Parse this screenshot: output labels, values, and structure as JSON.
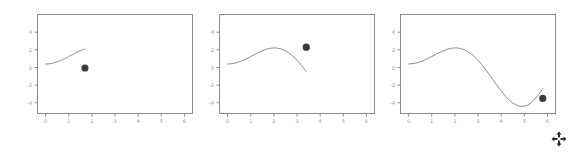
{
  "figure": {
    "background_color": "#ffffff",
    "panel_count": 3,
    "axes_color": "#888888",
    "line_color": "#808080",
    "marker_color": "#3c3c3c",
    "tick_label_color": "#999999"
  },
  "cursor": {
    "name": "move-cursor",
    "glyph": "move-four-arrows"
  },
  "chart_data": [
    {
      "type": "line",
      "title": "",
      "xlabel": "",
      "ylabel": "",
      "xlim": [
        -0.35,
        6.35
      ],
      "ylim": [
        -5.6,
        5.6
      ],
      "xticks": [
        0,
        1,
        2,
        3,
        4,
        5,
        6
      ],
      "yticks": [
        4,
        2,
        0,
        -2,
        -4
      ],
      "xtick_labels": [
        "0",
        "1",
        "2",
        "3",
        "4",
        "5",
        "6"
      ],
      "ytick_labels": [
        "4",
        "2",
        "0",
        "-2",
        "-4"
      ],
      "grid": false,
      "legend": false,
      "series": [
        {
          "name": "x*sin(x)",
          "x": [
            0.0,
            0.1,
            0.2,
            0.3,
            0.4,
            0.5,
            0.6,
            0.7,
            0.8,
            0.9,
            1.0,
            1.1,
            1.2,
            1.3,
            1.4,
            1.5,
            1.6,
            1.7
          ],
          "y": [
            0.0,
            0.01,
            0.04,
            0.089,
            0.156,
            0.24,
            0.339,
            0.451,
            0.574,
            0.705,
            0.841,
            0.98,
            1.118,
            1.252,
            1.379,
            1.496,
            1.599,
            1.685
          ]
        }
      ],
      "marker_point": {
        "x": 1.7,
        "y": -0.45
      }
    },
    {
      "type": "line",
      "title": "",
      "xlabel": "",
      "ylabel": "",
      "xlim": [
        -0.35,
        6.35
      ],
      "ylim": [
        -5.6,
        5.6
      ],
      "xticks": [
        0,
        1,
        2,
        3,
        4,
        5,
        6
      ],
      "yticks": [
        4,
        2,
        0,
        -2,
        -4
      ],
      "xtick_labels": [
        "0",
        "1",
        "2",
        "3",
        "4",
        "5",
        "6"
      ],
      "ytick_labels": [
        "4",
        "2",
        "0",
        "-2",
        "-4"
      ],
      "grid": false,
      "legend": false,
      "series": [
        {
          "name": "x*sin(x)",
          "x": [
            0.0,
            0.2,
            0.4,
            0.6,
            0.8,
            1.0,
            1.2,
            1.4,
            1.6,
            1.8,
            2.0,
            2.2,
            2.4,
            2.6,
            2.8,
            3.0,
            3.2,
            3.4
          ],
          "y": [
            0.0,
            0.04,
            0.156,
            0.339,
            0.574,
            0.841,
            1.118,
            1.379,
            1.599,
            1.753,
            1.819,
            1.777,
            1.62,
            1.336,
            0.942,
            0.423,
            -0.185,
            -0.85
          ]
        }
      ],
      "marker_point": {
        "x": 3.4,
        "y": 1.9
      }
    },
    {
      "type": "line",
      "title": "",
      "xlabel": "",
      "ylabel": "",
      "xlim": [
        -0.35,
        6.35
      ],
      "ylim": [
        -5.6,
        5.6
      ],
      "xticks": [
        0,
        1,
        2,
        3,
        4,
        5,
        6
      ],
      "yticks": [
        4,
        2,
        0,
        -2,
        -4
      ],
      "xtick_labels": [
        "0",
        "1",
        "2",
        "3",
        "4",
        "5",
        "6"
      ],
      "ytick_labels": [
        "4",
        "2",
        "0",
        "-2",
        "-4"
      ],
      "grid": false,
      "legend": false,
      "series": [
        {
          "name": "x*sin(x)",
          "x": [
            0.0,
            0.4,
            0.8,
            1.2,
            1.6,
            2.0,
            2.4,
            2.8,
            3.2,
            3.6,
            4.0,
            4.4,
            4.8,
            5.2,
            5.6,
            5.8
          ],
          "y": [
            0.0,
            0.156,
            0.574,
            1.118,
            1.599,
            1.819,
            1.62,
            0.942,
            -0.185,
            -1.6,
            -3.03,
            -4.2,
            -4.77,
            -4.57,
            -3.53,
            -2.76
          ]
        }
      ],
      "marker_point": {
        "x": 5.8,
        "y": -3.9
      }
    }
  ]
}
